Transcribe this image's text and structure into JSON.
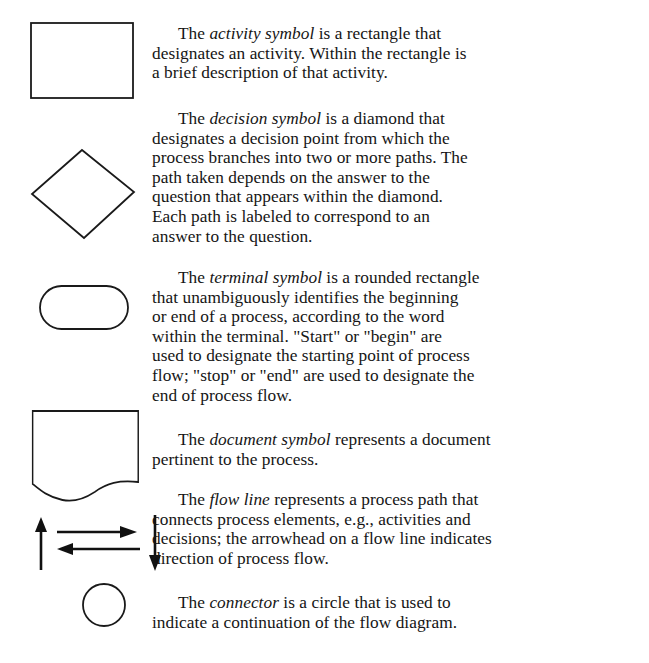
{
  "entries": [
    {
      "symbol": "rectangle",
      "lines": [
        {
          "pre": "The ",
          "term": "activity symbol",
          "post": " is a rectangle that"
        },
        {
          "text": "designates an activity. Within the rectangle is"
        },
        {
          "text": "a brief description of that activity."
        }
      ]
    },
    {
      "symbol": "diamond",
      "lines": [
        {
          "pre": "The ",
          "term": "decision symbol",
          "post": " is a diamond that"
        },
        {
          "text": "designates a decision point from which the"
        },
        {
          "text": "process branches into two or more paths. The"
        },
        {
          "text": "path taken depends on the answer to the"
        },
        {
          "text": "question that appears within the diamond."
        },
        {
          "text": "Each path is labeled to correspond to an"
        },
        {
          "text": "answer to the question."
        }
      ]
    },
    {
      "symbol": "rounded-rectangle",
      "lines": [
        {
          "pre": "The ",
          "term": "terminal symbol",
          "post": " is a rounded rectangle"
        },
        {
          "text": "that unambiguously identifies the beginning"
        },
        {
          "text": "or end of a process, according to the word"
        },
        {
          "text": "within the terminal. \"Start\" or \"begin\" are"
        },
        {
          "text": "used to designate the starting point of process"
        },
        {
          "text": "flow; \"stop\" or \"end\" are used to designate the"
        },
        {
          "text": "end of process flow."
        }
      ]
    },
    {
      "symbol": "document",
      "lines": [
        {
          "pre": "The ",
          "term": "document symbol",
          "post": " represents a document"
        },
        {
          "text": "pertinent to the process."
        }
      ]
    },
    {
      "symbol": "flow-lines",
      "lines": [
        {
          "pre": "The ",
          "term": "flow line",
          "post": " represents a process path that"
        },
        {
          "text": "connects process elements, e.g., activities and"
        },
        {
          "text": "decisions; the arrowhead on a flow line indicates"
        },
        {
          "text": "direction of process flow."
        }
      ]
    },
    {
      "symbol": "circle",
      "lines": [
        {
          "pre": "The ",
          "term": "connector",
          "post": " is a circle that is used to"
        },
        {
          "text": "indicate a continuation of the flow diagram."
        }
      ]
    }
  ],
  "colors": {
    "ink": "#151515",
    "paper": "#ffffff"
  }
}
